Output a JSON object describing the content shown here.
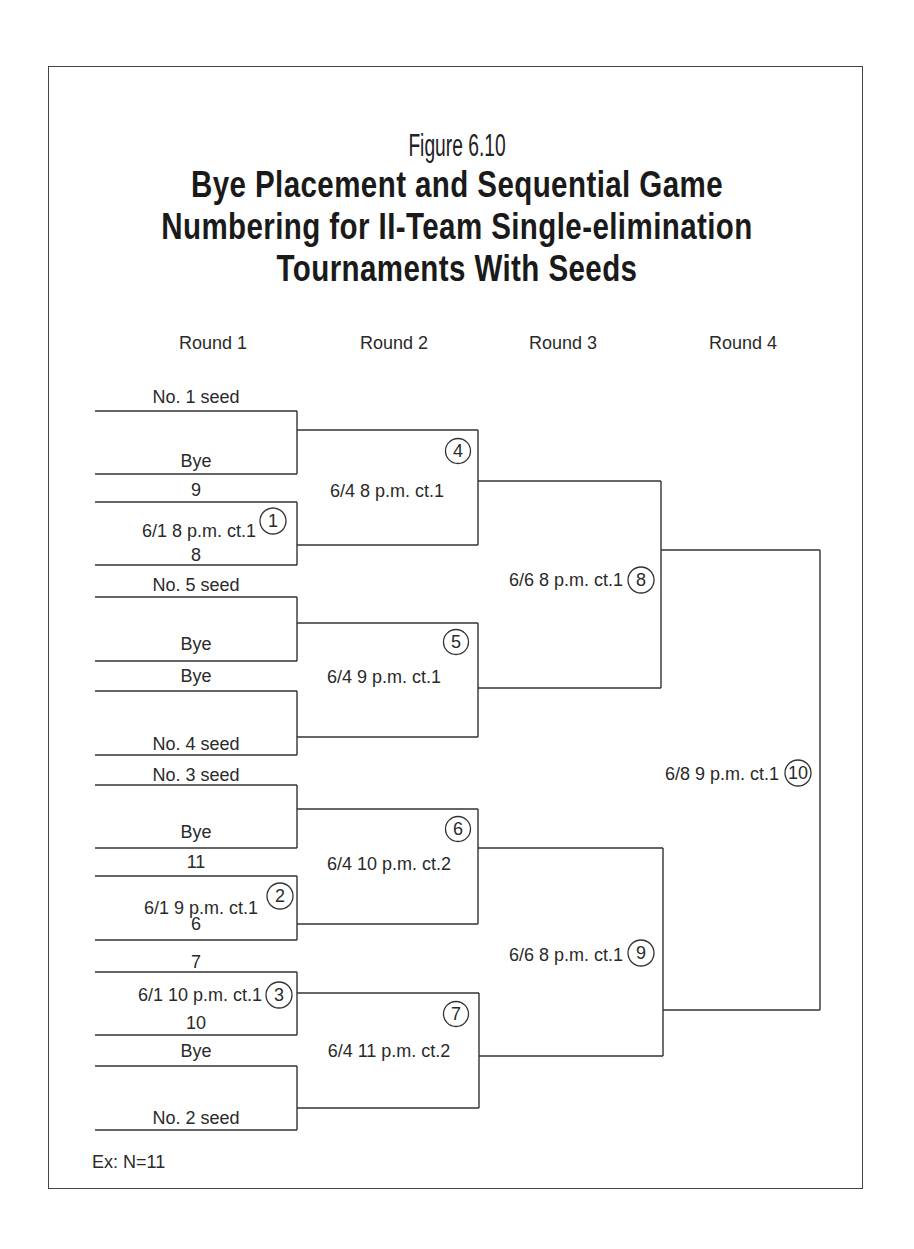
{
  "figure": {
    "label": "Figure 6.10",
    "title_lines": [
      "Bye Placement and Sequential Game",
      "Numbering for II-Team Single-elimination",
      "Tournaments With Seeds"
    ]
  },
  "rounds": [
    "Round 1",
    "Round 2",
    "Round 3",
    "Round 4"
  ],
  "round1": {
    "slots": [
      "No. 1 seed",
      "Bye",
      "9",
      "8",
      "No. 5 seed",
      "Bye",
      "Bye",
      "No. 4 seed",
      "No. 3 seed",
      "Bye",
      "11",
      "6",
      "7",
      "10",
      "Bye",
      "No. 2 seed"
    ],
    "games": [
      {
        "number": "1",
        "schedule": "6/1 8 p.m. ct.1"
      },
      {
        "number": "2",
        "schedule": "6/1  9 p.m. ct.1"
      },
      {
        "number": "3",
        "schedule": "6/1  10 p.m. ct.1"
      }
    ]
  },
  "round2": {
    "games": [
      {
        "number": "4",
        "schedule": "6/4  8 p.m. ct.1"
      },
      {
        "number": "5",
        "schedule": "6/4  9 p.m. ct.1"
      },
      {
        "number": "6",
        "schedule": "6/4  10 p.m. ct.2"
      },
      {
        "number": "7",
        "schedule": "6/4  11 p.m. ct.2"
      }
    ]
  },
  "round3": {
    "games": [
      {
        "number": "8",
        "schedule": "6/6  8 p.m. ct.1"
      },
      {
        "number": "9",
        "schedule": "6/6  8 p.m. ct.1"
      }
    ]
  },
  "round4": {
    "games": [
      {
        "number": "10",
        "schedule": "6/8  9 p.m. ct.1"
      }
    ]
  },
  "footnote": "Ex: N=11"
}
